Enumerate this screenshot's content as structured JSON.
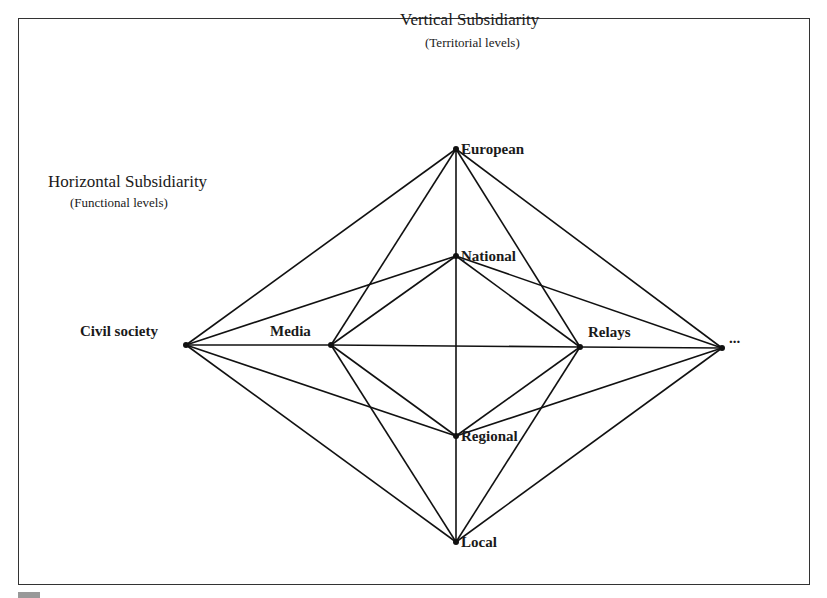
{
  "vertical": {
    "title": "Vertical Subsidiarity",
    "subtitle": "(Territorial levels)"
  },
  "horizontal": {
    "title": "Horizontal Subsidiarity",
    "subtitle": "(Functional levels)"
  },
  "nodes": {
    "european": {
      "label": "European",
      "x": 456,
      "y": 149
    },
    "national": {
      "label": "National",
      "x": 456,
      "y": 256
    },
    "regional": {
      "label": "Regional",
      "x": 456,
      "y": 436
    },
    "local": {
      "label": "Local",
      "x": 456,
      "y": 542
    },
    "civil_society": {
      "label": "Civil society",
      "x": 186,
      "y": 345
    },
    "media": {
      "label": "Media",
      "x": 331,
      "y": 345
    },
    "relays": {
      "label": "Relays",
      "x": 580,
      "y": 347
    },
    "more": {
      "label": "...",
      "x": 722,
      "y": 348
    }
  },
  "edges": [
    [
      "civil_society",
      "european"
    ],
    [
      "civil_society",
      "national"
    ],
    [
      "civil_society",
      "media"
    ],
    [
      "civil_society",
      "regional"
    ],
    [
      "civil_society",
      "local"
    ],
    [
      "media",
      "european"
    ],
    [
      "media",
      "national"
    ],
    [
      "media",
      "relays"
    ],
    [
      "media",
      "regional"
    ],
    [
      "media",
      "local"
    ],
    [
      "relays",
      "european"
    ],
    [
      "relays",
      "national"
    ],
    [
      "relays",
      "more"
    ],
    [
      "relays",
      "regional"
    ],
    [
      "relays",
      "local"
    ],
    [
      "more",
      "european"
    ],
    [
      "more",
      "national"
    ],
    [
      "more",
      "regional"
    ],
    [
      "more",
      "local"
    ],
    [
      "european",
      "national"
    ],
    [
      "national",
      "regional"
    ],
    [
      "regional",
      "local"
    ]
  ],
  "colors": {
    "line": "#111111",
    "text": "#1a1a1a",
    "frame": "#333333"
  }
}
